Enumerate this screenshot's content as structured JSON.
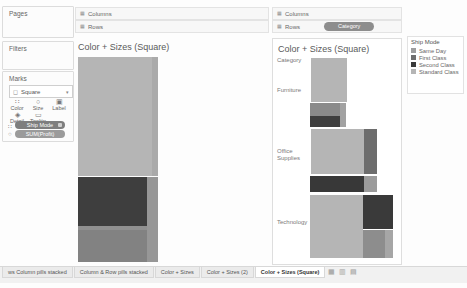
{
  "left_panel": {
    "pages_label": "Pages",
    "filters_label": "Filters",
    "marks_card": {
      "label": "Marks",
      "mark_type": "Square",
      "type_glyph": "◻",
      "caret": "▾",
      "buttons": [
        {
          "label": "Color",
          "glyph": "∷"
        },
        {
          "label": "Size",
          "glyph": "○"
        },
        {
          "label": "Label",
          "glyph": "▣"
        },
        {
          "label": "Detail",
          "glyph": "◈"
        },
        {
          "label": "Tooltip",
          "glyph": "▭"
        }
      ],
      "pills": [
        {
          "label": "Ship Mode",
          "shelf_glyph": "∷",
          "color": "#7e7e7e"
        },
        {
          "label": "SUM(Profit)",
          "shelf_glyph": "○",
          "color": "#9b9b9b"
        }
      ]
    }
  },
  "left_view": {
    "columns_label": "Columns",
    "rows_label": "Rows",
    "shelf_glyph": "▦",
    "title": "Color + Sizes (Square)",
    "marks": [
      {
        "name": "standard-class",
        "x": 78,
        "y": 57,
        "w": 74,
        "h": 119,
        "color": "#b5b5b5"
      },
      {
        "name": "standard-class-edge",
        "x": 152,
        "y": 57,
        "w": 6,
        "h": 119,
        "color": "#aaaaaa"
      },
      {
        "name": "second-class",
        "x": 78,
        "y": 177,
        "w": 69,
        "h": 49,
        "color": "#3e3e3e"
      },
      {
        "name": "same-day-strip",
        "x": 147,
        "y": 177,
        "w": 11,
        "h": 85,
        "color": "#979797"
      },
      {
        "name": "first-class-edge",
        "x": 78,
        "y": 226,
        "w": 69,
        "h": 4,
        "color": "#909090"
      },
      {
        "name": "first-class",
        "x": 78,
        "y": 230,
        "w": 69,
        "h": 32,
        "color": "#828282"
      }
    ]
  },
  "right_view": {
    "columns_label": "Columns",
    "rows_label": "Rows",
    "rows_pill": "Category",
    "shelf_glyph": "▦",
    "title": "Color + Sizes (Square)",
    "category_header": "Category",
    "row_labels": [
      {
        "text": "Furniture",
        "y": 87
      },
      {
        "text": "Office Supplies",
        "y": 148
      },
      {
        "text": "Technology",
        "y": 219
      }
    ],
    "marks": [
      {
        "name": "furniture-standard",
        "x": 311,
        "y": 58,
        "w": 36,
        "h": 44,
        "color": "#b5b5b5"
      },
      {
        "name": "furniture-first",
        "x": 310,
        "y": 103,
        "w": 30,
        "h": 13,
        "color": "#8a8a8a"
      },
      {
        "name": "furniture-second",
        "x": 310,
        "y": 116,
        "w": 30,
        "h": 11,
        "color": "#3e3e3e"
      },
      {
        "name": "furniture-same-day",
        "x": 340,
        "y": 103,
        "w": 6,
        "h": 24,
        "color": "#a2a2a2"
      },
      {
        "name": "office-standard",
        "x": 311,
        "y": 129,
        "w": 53,
        "h": 45,
        "color": "#b5b5b5"
      },
      {
        "name": "office-first",
        "x": 364,
        "y": 129,
        "w": 13,
        "h": 45,
        "color": "#6d6d6d"
      },
      {
        "name": "office-second",
        "x": 310,
        "y": 176,
        "w": 54,
        "h": 16,
        "color": "#383838"
      },
      {
        "name": "office-same-day",
        "x": 364,
        "y": 176,
        "w": 13,
        "h": 16,
        "color": "#9b9b9b"
      },
      {
        "name": "tech-standard",
        "x": 310,
        "y": 195,
        "w": 53,
        "h": 63,
        "color": "#b5b5b5"
      },
      {
        "name": "tech-second",
        "x": 363,
        "y": 195,
        "w": 30,
        "h": 34,
        "color": "#3a3a3a"
      },
      {
        "name": "tech-first",
        "x": 363,
        "y": 230,
        "w": 22,
        "h": 28,
        "color": "#8d8d8d"
      },
      {
        "name": "tech-same-day",
        "x": 385,
        "y": 230,
        "w": 8,
        "h": 28,
        "color": "#a6a6a6"
      }
    ]
  },
  "legend": {
    "title": "Ship Mode",
    "items": [
      {
        "label": "Same Day",
        "color": "#9e9e9e"
      },
      {
        "label": "First Class",
        "color": "#6f6f6f"
      },
      {
        "label": "Second Class",
        "color": "#3a3a3a"
      },
      {
        "label": "Standard Class",
        "color": "#b5b5b5"
      }
    ]
  },
  "tab_bar": {
    "tabs": [
      {
        "label": "ws Column pills stacked",
        "selected": false
      },
      {
        "label": "Column & Row pills stacked",
        "selected": false
      },
      {
        "label": "Color + Sizes",
        "selected": false
      },
      {
        "label": "Color + Sizes (2)",
        "selected": false
      },
      {
        "label": "Color + Sizes (Square)",
        "selected": true
      }
    ],
    "icons": [
      "new-worksheet-icon",
      "new-dashboard-icon",
      "new-story-icon"
    ]
  }
}
